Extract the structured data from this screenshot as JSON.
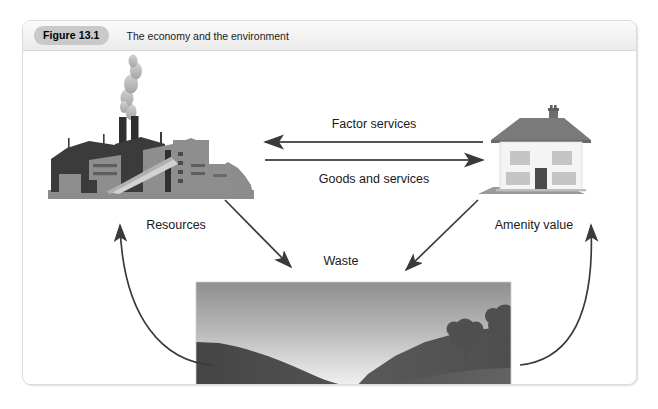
{
  "figure": {
    "badge": "Figure 13.1",
    "title": "The economy and the environment"
  },
  "diagram": {
    "labels": {
      "factor_services": "Factor services",
      "goods_and_services": "Goods and services",
      "resources": "Resources",
      "waste": "Waste",
      "amenity_value": "Amenity value"
    },
    "nodes": {
      "factory": "factory-illustration",
      "house": "house-illustration",
      "landscape": "landscape-illustration"
    },
    "arrows": [
      {
        "name": "factor-services-arrow",
        "direction": "right-to-left",
        "label": "Factor services"
      },
      {
        "name": "goods-and-services-arrow",
        "direction": "left-to-right",
        "label": "Goods and services"
      },
      {
        "name": "waste-from-factory-arrow",
        "direction": "down-right",
        "label": "Waste"
      },
      {
        "name": "waste-from-house-arrow",
        "direction": "down-left",
        "label": "Waste"
      },
      {
        "name": "resources-arrow",
        "direction": "curved-up-left",
        "label": "Resources"
      },
      {
        "name": "amenity-value-arrow",
        "direction": "curved-up-right",
        "label": "Amenity value"
      }
    ]
  },
  "colors": {
    "card_border": "#dcdcdc",
    "header_bg": "#f2f2f2",
    "badge_bg": "#c9c9c9",
    "arrow": "#4a4a4a",
    "text": "#1a1a1a",
    "factory_dark": "#3b3b3b",
    "factory_mid": "#8e8e8e",
    "factory_ground": "#8c8c8c",
    "smoke": "#b5b5b5",
    "house_wall": "#f4f4f4",
    "house_roof": "#7a7a7a",
    "house_window": "#c5c5c5",
    "house_door": "#4a4a4a",
    "landscape_sky_top": "#9a9a9a",
    "landscape_sky_bottom": "#f0f0f0",
    "landscape_hill_dark": "#4f4f4f",
    "landscape_hill_mid": "#5e5e5e",
    "landscape_tree": "#555555"
  }
}
